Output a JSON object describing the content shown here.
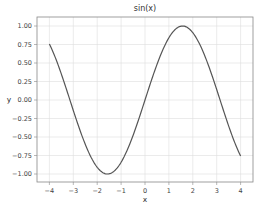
{
  "chart_data": {
    "type": "line",
    "title": "sin(x)",
    "xlabel": "x",
    "ylabel": "y",
    "xlim": [
      -4.5,
      4.5
    ],
    "ylim": [
      -1.12,
      1.12
    ],
    "x_ticks": [
      -4,
      -3,
      -2,
      -1,
      0,
      1,
      2,
      3,
      4
    ],
    "x_tick_labels": [
      "−4",
      "−3",
      "−2",
      "−1",
      "0",
      "1",
      "2",
      "3",
      "4"
    ],
    "y_ticks": [
      1.0,
      0.75,
      0.5,
      0.25,
      0.0,
      -0.25,
      -0.5,
      -0.75,
      -1.0
    ],
    "y_tick_labels": [
      "1.00",
      "0.75",
      "0.50",
      "0.25",
      "0.00",
      "−0.25",
      "−0.50",
      "−0.75",
      "−1.00"
    ],
    "grid": true,
    "legend": null,
    "series": [
      {
        "name": "sin(x)",
        "function": "sin",
        "x_range": [
          -4,
          4
        ],
        "color": "#555555",
        "x": [
          -4,
          -3.5,
          -3,
          -2.5,
          -2,
          -1.5708,
          -1,
          -0.5,
          0,
          0.5,
          1,
          1.5708,
          2,
          2.5,
          3,
          3.5,
          4
        ],
        "y": [
          0.757,
          0.351,
          -0.141,
          -0.598,
          -0.909,
          -1.0,
          -0.841,
          -0.479,
          0.0,
          0.479,
          0.841,
          1.0,
          0.909,
          0.598,
          0.141,
          -0.351,
          -0.757
        ]
      }
    ]
  },
  "colors": {
    "line": "#555555",
    "grid": "#dddddd",
    "frame": "#888888"
  }
}
